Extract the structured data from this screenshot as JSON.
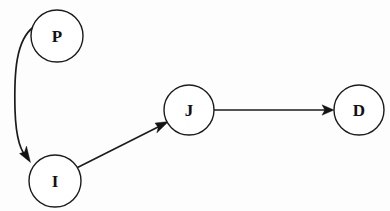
{
  "diagram": {
    "type": "directed-graph",
    "background_color": "#fdfdfd",
    "stroke_color": "#1b1b1b",
    "node_fill_color": "#ffffff",
    "label_color": "#111111",
    "nodes": [
      {
        "id": "P",
        "label": "P",
        "cx": 57,
        "cy": 36,
        "r": 26
      },
      {
        "id": "I",
        "label": "I",
        "cx": 55,
        "cy": 181,
        "r": 26
      },
      {
        "id": "J",
        "label": "J",
        "cx": 189,
        "cy": 110,
        "r": 25
      },
      {
        "id": "D",
        "label": "D",
        "cx": 359,
        "cy": 110,
        "r": 25
      }
    ],
    "edges": [
      {
        "id": "P-to-I",
        "from": "P",
        "to": "I",
        "style": "curved",
        "directed": true
      },
      {
        "id": "I-to-J",
        "from": "I",
        "to": "J",
        "style": "straight",
        "directed": true
      },
      {
        "id": "J-to-D",
        "from": "J",
        "to": "D",
        "style": "straight",
        "directed": true
      }
    ]
  }
}
